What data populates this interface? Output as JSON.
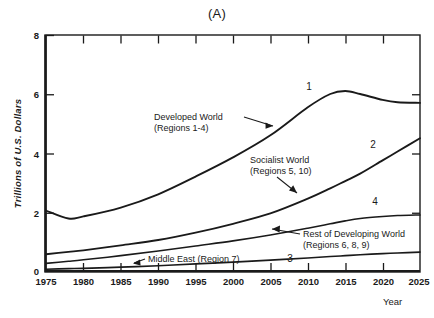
{
  "chart_data": {
    "type": "line",
    "title": "(A)",
    "xlabel": "Year",
    "ylabel": "Trillions of U.S. Dollars",
    "xlim": [
      1975,
      2025
    ],
    "ylim": [
      0,
      8
    ],
    "grid": false,
    "legend_position": "inline-annotations",
    "x_ticks": [
      "1975",
      "1980",
      "1985",
      "1990",
      "1995",
      "2000",
      "2005",
      "2010",
      "2015",
      "2020",
      "2025"
    ],
    "y_ticks": [
      "0",
      "2",
      "4",
      "6",
      "8"
    ],
    "x": [
      1975,
      1978,
      1980,
      1985,
      1990,
      1995,
      2000,
      2005,
      2010,
      2013,
      2015,
      2017,
      2020,
      2022,
      2025
    ],
    "series": [
      {
        "name": "Developed World (Regions 1-4)",
        "curve_number": "1",
        "values": [
          2.05,
          1.78,
          1.85,
          2.15,
          2.6,
          3.2,
          3.85,
          4.6,
          5.55,
          6.0,
          6.1,
          6.0,
          5.8,
          5.72,
          5.7
        ]
      },
      {
        "name": "Socialist World (Regions 5, 10)",
        "curve_number": "2",
        "values": [
          0.57,
          0.65,
          0.7,
          0.87,
          1.05,
          1.3,
          1.6,
          1.95,
          2.45,
          2.8,
          3.05,
          3.3,
          3.75,
          4.05,
          4.5
        ]
      },
      {
        "name": "Rest of Developing World (Regions 6, 8, 9)",
        "curve_number": "4",
        "values": [
          0.26,
          0.33,
          0.38,
          0.52,
          0.68,
          0.85,
          1.02,
          1.22,
          1.45,
          1.6,
          1.7,
          1.78,
          1.85,
          1.88,
          1.9
        ]
      },
      {
        "name": "Middle East (Region 7)",
        "curve_number": "3",
        "values": [
          0.06,
          0.08,
          0.09,
          0.13,
          0.18,
          0.24,
          0.3,
          0.37,
          0.44,
          0.49,
          0.52,
          0.55,
          0.59,
          0.61,
          0.64
        ]
      }
    ],
    "annotations": [
      {
        "id": "developed-world",
        "line1": "Developed World",
        "line2": "(Regions 1-4)"
      },
      {
        "id": "socialist-world",
        "line1": "Socialist World",
        "line2": "(Regions 5, 10)"
      },
      {
        "id": "rest-of-developing-world",
        "line1": "Rest of Developing World",
        "line2": "(Regions 6, 8, 9)"
      },
      {
        "id": "middle-east",
        "line1": "Middle East (Region 7)",
        "line2": ""
      }
    ],
    "curve_labels": [
      "1",
      "2",
      "4",
      "3"
    ],
    "colors": {
      "axis": "#1a1a1a",
      "curve": "#1a1a1a",
      "background": "#ffffff"
    }
  }
}
